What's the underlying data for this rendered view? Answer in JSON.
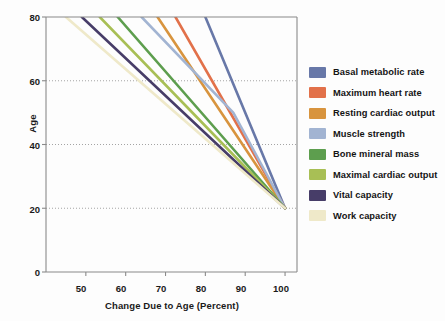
{
  "chart_data": {
    "type": "line",
    "title": "",
    "xlabel": "Change Due to Age (Percent)",
    "ylabel": "Age",
    "xlim": [
      40,
      103
    ],
    "ylim": [
      0,
      80
    ],
    "xticks": [
      50,
      60,
      70,
      80,
      90,
      100
    ],
    "yticks": [
      0,
      20,
      40,
      60,
      80
    ],
    "grid": "horizontal-dotted",
    "legend_position": "right",
    "note": "Each series is a line of physiological capacity (percent of young-adult value) versus age; all series converge at 100 percent at age 20.",
    "series": [
      {
        "name": "Basal metabolic rate",
        "color": "#6878a8",
        "points": [
          [
            80,
            80
          ],
          [
            100,
            20
          ]
        ]
      },
      {
        "name": "Maximum heart rate",
        "color": "#e2714a",
        "points": [
          [
            72.5,
            80
          ],
          [
            100,
            20
          ]
        ]
      },
      {
        "name": "Resting cardiac output",
        "color": "#d8943e",
        "points": [
          [
            68,
            80
          ],
          [
            100,
            20
          ]
        ]
      },
      {
        "name": "Muscle strength",
        "color": "#a2b4d2",
        "points": [
          [
            64,
            80
          ],
          [
            87,
            50
          ],
          [
            100,
            20
          ]
        ]
      },
      {
        "name": "Bone mineral mass",
        "color": "#5d9e4e",
        "points": [
          [
            58,
            80
          ],
          [
            100,
            20
          ]
        ]
      },
      {
        "name": "Maximal cardiac output",
        "color": "#a8bf55",
        "points": [
          [
            53.5,
            80
          ],
          [
            100,
            20
          ]
        ]
      },
      {
        "name": "Vital capacity",
        "color": "#473d68",
        "points": [
          [
            49,
            80
          ],
          [
            100,
            20
          ]
        ]
      },
      {
        "name": "Work capacity",
        "color": "#efe9c9",
        "points": [
          [
            45,
            80
          ],
          [
            100,
            20
          ]
        ]
      }
    ]
  },
  "axes": {
    "y_title": "Age",
    "x_title": "Change Due to Age (Percent)",
    "y_tick_labels": [
      "80",
      "60",
      "40",
      "20",
      "0"
    ],
    "x_tick_labels": [
      "50",
      "60",
      "70",
      "80",
      "90",
      "100"
    ]
  },
  "legend": {
    "items": [
      {
        "label": "Basal metabolic rate",
        "color": "#6878a8"
      },
      {
        "label": "Maximum heart rate",
        "color": "#e2714a"
      },
      {
        "label": "Resting cardiac output",
        "color": "#d8943e"
      },
      {
        "label": "Muscle strength",
        "color": "#a2b4d2"
      },
      {
        "label": "Bone mineral mass",
        "color": "#5d9e4e"
      },
      {
        "label": "Maximal cardiac output",
        "color": "#a8bf55"
      },
      {
        "label": "Vital capacity",
        "color": "#473d68"
      },
      {
        "label": "Work capacity",
        "color": "#efe9c9"
      }
    ]
  },
  "style": {
    "axis_color": "#8a8a8a",
    "grid_color": "#9a9a9a",
    "background": "#fdfdfd",
    "text_color": "#141414"
  }
}
